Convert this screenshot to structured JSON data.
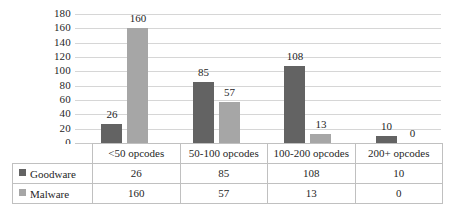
{
  "chart_data": {
    "type": "bar",
    "title": "",
    "subtitle": "",
    "xlabel": "",
    "ylabel": "",
    "categories": [
      "<50 opcodes",
      "50-100 opcodes",
      "100-200 opcodes",
      "200+ opcodes"
    ],
    "series": [
      {
        "name": "Goodware",
        "values": [
          26,
          85,
          108,
          10
        ],
        "color": "#636363"
      },
      {
        "name": "Malware",
        "values": [
          160,
          57,
          13,
          0
        ],
        "color": "#a6a6a6"
      }
    ],
    "ylim": [
      0,
      180
    ],
    "yticks": [
      180,
      160,
      140,
      120,
      100,
      80,
      60,
      40,
      20,
      0
    ],
    "ytick_labels": [
      "180",
      "160",
      "140",
      "120",
      "100",
      "80",
      "60",
      "40",
      "20",
      "0"
    ],
    "grid": true,
    "legend_position": "data-table-left",
    "data_labels": {
      "Goodware": [
        "26",
        "85",
        "108",
        "10"
      ],
      "Malware": [
        "160",
        "57",
        "13",
        "0"
      ]
    }
  },
  "data_table": {
    "corner_label": "",
    "header_row": [
      "<50 opcodes",
      "50-100 opcodes",
      "100-200 opcodes",
      "200+ opcodes"
    ],
    "rows": [
      {
        "label": "Goodware",
        "swatch_color": "#636363",
        "values": [
          "26",
          "85",
          "108",
          "10"
        ]
      },
      {
        "label": "Malware",
        "swatch_color": "#a6a6a6",
        "values": [
          "160",
          "57",
          "13",
          "0"
        ]
      }
    ]
  },
  "colors": {
    "goodware": "#636363",
    "malware": "#a6a6a6",
    "gridline": "#d6d6d6",
    "table_border": "#c0c0c0",
    "text": "#1f1f1f",
    "background": "#ffffff"
  }
}
